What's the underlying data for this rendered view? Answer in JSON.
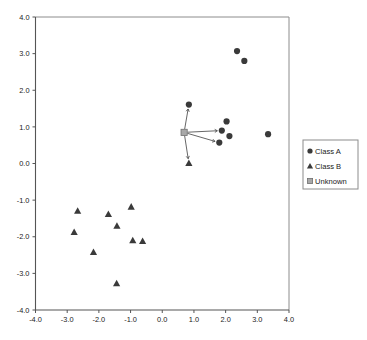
{
  "chart_data": {
    "type": "scatter",
    "title": "",
    "xlabel": "",
    "ylabel": "",
    "xlim": [
      -4.0,
      4.0
    ],
    "ylim": [
      -4.0,
      4.0
    ],
    "xticks": [
      "-4.0",
      "-3.0",
      "-2.0",
      "-1.0",
      "0.0",
      "1.0",
      "2.0",
      "3.0",
      "4.0"
    ],
    "yticks": [
      "4.0",
      "3.0",
      "2.0",
      "1.0",
      "0.0",
      "-1.0",
      "-2.0",
      "-3.0",
      "-4.0"
    ],
    "xtick_values": [
      -4,
      -3,
      -2,
      -1,
      0,
      1,
      2,
      3,
      4
    ],
    "ytick_values": [
      4,
      3,
      2,
      1,
      0,
      -1,
      -2,
      -3,
      -4
    ],
    "grid": false,
    "legend_position": "right-outside",
    "series": [
      {
        "name": "Class A",
        "marker": "circle",
        "color": "#3a3a3a",
        "points": [
          [
            2.36,
            3.07
          ],
          [
            2.59,
            2.8
          ],
          [
            0.84,
            1.61
          ],
          [
            2.03,
            1.15
          ],
          [
            1.88,
            0.9
          ],
          [
            2.12,
            0.75
          ],
          [
            1.8,
            0.57
          ],
          [
            3.34,
            0.8
          ]
        ]
      },
      {
        "name": "Class B",
        "marker": "triangle",
        "color": "#3a3a3a",
        "points": [
          [
            -2.67,
            -1.29
          ],
          [
            -2.78,
            -1.87
          ],
          [
            -2.17,
            -2.42
          ],
          [
            -1.7,
            -1.38
          ],
          [
            -1.43,
            -1.7
          ],
          [
            -1.44,
            -3.27
          ],
          [
            -0.98,
            -1.18
          ],
          [
            -0.93,
            -2.1
          ],
          [
            -0.62,
            -2.12
          ],
          [
            0.84,
            0.01
          ]
        ]
      },
      {
        "name": "Unknown",
        "marker": "square",
        "color": "#a8a8a8",
        "points": [
          [
            0.69,
            0.85
          ]
        ]
      }
    ],
    "annotations": {
      "description": "arrows from Unknown point to its nearest neighbors",
      "arrows": [
        {
          "from": [
            0.69,
            0.85
          ],
          "to": [
            0.84,
            1.61
          ]
        },
        {
          "from": [
            0.69,
            0.85
          ],
          "to": [
            1.88,
            0.9
          ]
        },
        {
          "from": [
            0.69,
            0.85
          ],
          "to": [
            1.8,
            0.57
          ]
        },
        {
          "from": [
            0.69,
            0.85
          ],
          "to": [
            0.84,
            0.01
          ]
        }
      ]
    },
    "legend": [
      {
        "label": "Class A",
        "marker": "circle"
      },
      {
        "label": "Class B",
        "marker": "triangle"
      },
      {
        "label": "Unknown",
        "marker": "square"
      }
    ]
  },
  "colors": {
    "point": "#3a3a3a",
    "unknown": "#a8a8a8",
    "axis": "#555555",
    "frame": "#8c8c8c",
    "background": "#ffffff"
  }
}
